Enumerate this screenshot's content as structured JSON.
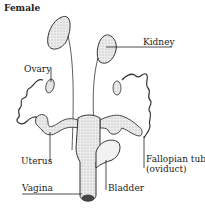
{
  "title": "Female",
  "labels": {
    "kidney": "Kidney",
    "ovary": "Ovary",
    "uterus": "Uterus",
    "fallopian_tube": "Fallopian tube",
    "oviduct": "(oviduct)",
    "vagina": "Vagina",
    "bladder": "Bladder"
  },
  "colors": {
    "line": "#333333",
    "organ_fill": "#e2e2e2",
    "background": "#ffffff"
  }
}
